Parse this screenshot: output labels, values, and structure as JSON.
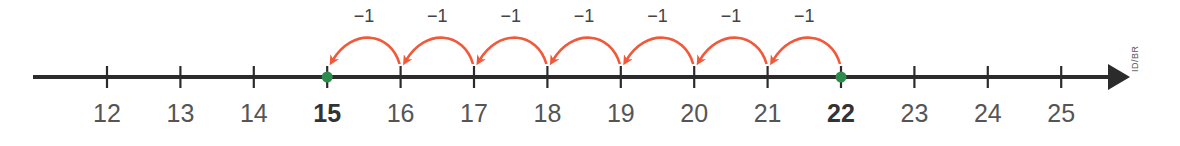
{
  "number_line": {
    "start": 12,
    "end": 25,
    "ticks": [
      12,
      13,
      14,
      15,
      16,
      17,
      18,
      19,
      20,
      21,
      22,
      23,
      24,
      25
    ],
    "highlighted": [
      15,
      22
    ],
    "colors": {
      "axis": "#2b2b2b",
      "jump": "#f05a3a",
      "point": "#2e8b4e",
      "label": "#555555"
    }
  },
  "jumps": [
    {
      "from": 22,
      "to": 21,
      "label": "−1"
    },
    {
      "from": 21,
      "to": 20,
      "label": "−1"
    },
    {
      "from": 20,
      "to": 19,
      "label": "−1"
    },
    {
      "from": 19,
      "to": 18,
      "label": "−1"
    },
    {
      "from": 18,
      "to": 17,
      "label": "−1"
    },
    {
      "from": 17,
      "to": 16,
      "label": "−1"
    },
    {
      "from": 16,
      "to": 15,
      "label": "−1"
    }
  ],
  "credit": "ID/BR"
}
